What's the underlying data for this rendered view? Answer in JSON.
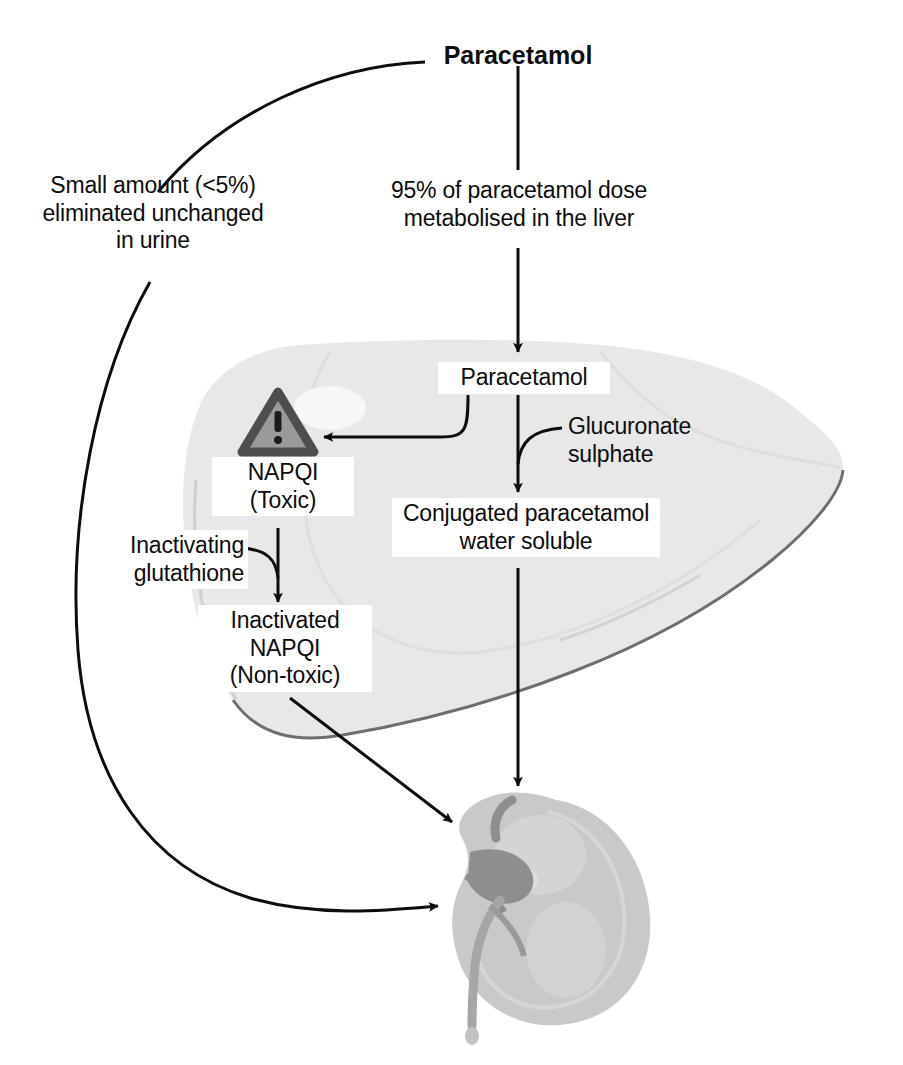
{
  "diagram": {
    "title": "Paracetamol",
    "organs": {
      "liver_label": "liver-illustration",
      "kidney_label": "kidney-illustration"
    },
    "colors": {
      "ink": "#0d0d0d",
      "liver_fill": "#e8e8e8",
      "liver_fill_dark": "#dcdcdc",
      "liver_outline": "#6e6e6e",
      "kidney_fill": "#c9c9c9",
      "kidney_fill_light": "#d8d8d8",
      "kidney_vessel": "#8e8e8e",
      "warning_fill": "#9a9a9a",
      "warning_border": "#4e4e4e",
      "background": "#ffffff"
    },
    "nodes": {
      "top_drug": "Paracetamol",
      "renal_branch": "Small amount (<5%)\neliminated unchanged\nin urine",
      "hepatic_branch": "95% of paracetamol dose\nmetabolised in the liver",
      "liver_drug": "Paracetamol",
      "napqi_toxic": "NAPQI\n(Toxic)",
      "cofactors": "Glucuronate\nsulphate",
      "conjugate": "Conjugated paracetamol\nwater soluble",
      "glutathione": "Inactivating\nglutathione",
      "napqi_inactivated": "Inactivated\nNAPQI\n(Non-toxic)"
    },
    "icons": {
      "warning": "warning-triangle-icon",
      "warning_glyph": "!"
    }
  }
}
